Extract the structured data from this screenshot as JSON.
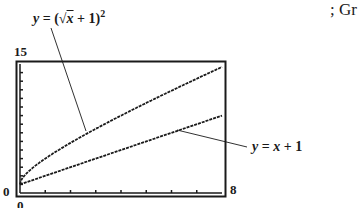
{
  "chart_data": {
    "type": "line",
    "title": "",
    "xlabel": "",
    "ylabel": "",
    "xlim": [
      0,
      8
    ],
    "ylim": [
      0,
      15
    ],
    "x_tick_labels": {
      "min": "0",
      "max": "8"
    },
    "y_tick_labels": {
      "min": "0",
      "max": "15"
    },
    "grid": false,
    "x_ticks_count": 8,
    "y_ticks_count": 15,
    "series": [
      {
        "name": "y = (√x + 1)^2",
        "label_prefix": "y = (√",
        "label_var": "x",
        "label_suffix": " + 1)",
        "label_exp": "2",
        "x": [
          0,
          0.25,
          0.5,
          1,
          2,
          3,
          4,
          5,
          6,
          7,
          8
        ],
        "values": [
          1,
          2.25,
          2.91,
          4,
          5.83,
          7.46,
          9,
          10.47,
          11.9,
          13.29,
          14.66
        ]
      },
      {
        "name": "y = x + 1",
        "label": "y = x + 1",
        "x": [
          0,
          8
        ],
        "values": [
          1,
          9
        ]
      }
    ],
    "annotations": [
      {
        "text": "y = (√x + 1)^2",
        "points_to_x": 2.7
      },
      {
        "text": "y = x + 1",
        "points_to_x": 6.5
      }
    ]
  },
  "labels": {
    "y_top": "15",
    "y_bottom": "0",
    "x_left": "0",
    "x_right": "8",
    "curve1_y": "y",
    "curve1_eq": " = (√",
    "curve1_x": "x",
    "curve1_rest": " + 1)",
    "curve1_exp": "2",
    "curve2_y": "y",
    "curve2_eq": " = ",
    "curve2_x": "x",
    "curve2_rest": " + 1"
  },
  "caption_fragment": "; Gr"
}
